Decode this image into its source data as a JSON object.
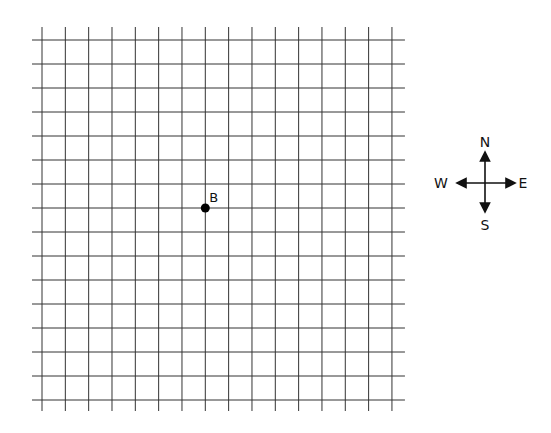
{
  "grid": {
    "columns": 16,
    "rows": 16,
    "x0": 42,
    "dx": 23.33,
    "y0": 40,
    "dy": 24,
    "line_color": "#333333"
  },
  "point": {
    "label": "B",
    "col": 7,
    "row": 7,
    "color": "#000000"
  },
  "compass": {
    "north": "N",
    "south": "S",
    "east": "E",
    "west": "W"
  }
}
